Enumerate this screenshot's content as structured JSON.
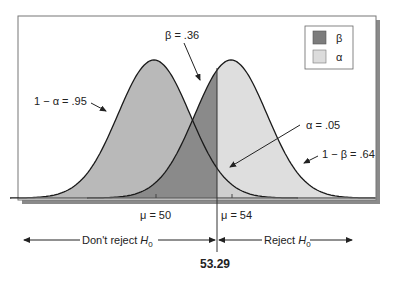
{
  "diagram": {
    "legend": [
      {
        "symbol": "β",
        "color": "#7c7c7c"
      },
      {
        "symbol": "α",
        "color": "#dcdcdc"
      }
    ],
    "annotations": {
      "one_minus_alpha": "1 − α = .95",
      "beta": "β = .36",
      "alpha": "α = .05",
      "one_minus_beta": "1 − β = .64"
    },
    "axis": {
      "mu0": "μ = 50",
      "mu1": "μ = 54",
      "critical_value": "53.29"
    },
    "regions": {
      "dont_reject_prefix": "Don't reject ",
      "reject_prefix": "Reject ",
      "h": "H",
      "sub": "0"
    },
    "colors": {
      "h0_fill": "#b9b9b9",
      "h1_fill": "#dedede",
      "beta_fill": "#808080",
      "frame": "#555555",
      "shadow": "#8a8a8a"
    }
  }
}
